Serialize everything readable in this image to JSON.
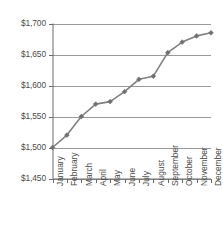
{
  "chart_data": {
    "type": "line",
    "title": "",
    "subtitle": "",
    "xlabel": "",
    "ylabel": "",
    "categories": [
      "January",
      "February",
      "March",
      "April",
      "May",
      "June",
      "July",
      "August",
      "September",
      "October",
      "November",
      "December"
    ],
    "values": [
      1500,
      1520,
      1550,
      1570,
      1574,
      1590,
      1610,
      1615,
      1653,
      1670,
      1680,
      1685
    ],
    "series": [
      {
        "name": "",
        "values": [
          1500,
          1520,
          1550,
          1570,
          1574,
          1590,
          1610,
          1615,
          1653,
          1670,
          1680,
          1685
        ]
      }
    ],
    "ylim": [
      1450,
      1700
    ],
    "ytick_values": [
      1450,
      1500,
      1550,
      1600,
      1650,
      1700
    ],
    "ytick_labels": [
      "$1,450",
      "$1,500",
      "$1,550",
      "$1,600",
      "$1,650",
      "$1,700"
    ],
    "grid": true,
    "grid_axis": "y",
    "legend": "none",
    "marker": "diamond",
    "line_color": "#808080",
    "marker_color": "#707070",
    "grid_color": "#999999",
    "axis_color": "#6b6b6b",
    "text_color": "#4a4a4a",
    "background_color": "#ffffff"
  },
  "axes": {
    "y_axis_name": "value-axis",
    "x_axis_name": "month-axis"
  }
}
